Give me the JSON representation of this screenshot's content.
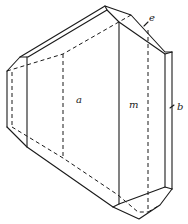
{
  "figure": {
    "type": "crystal-drawing",
    "labels": {
      "a": "a",
      "m": "m",
      "b": "b",
      "e": "e"
    },
    "colors": {
      "line": "#1a1a1a",
      "background": "#ffffff"
    }
  }
}
